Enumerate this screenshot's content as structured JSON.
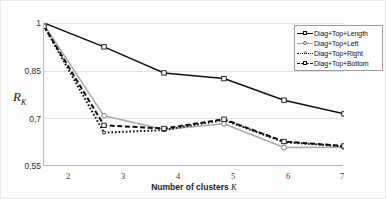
{
  "chart_data": {
    "type": "line",
    "title": "",
    "xlabel": "Number of clusters K",
    "ylabel": "R_K",
    "x": [
      2,
      3,
      4,
      5,
      6,
      7
    ],
    "xticklabels": [
      "2",
      "3",
      "4",
      "5",
      "6",
      "7"
    ],
    "yticklabels": [
      "1",
      "0,85",
      "0,7",
      "0,55"
    ],
    "ytickvalues": [
      1,
      0.85,
      0.7,
      0.55
    ],
    "ylim": [
      0.55,
      1.0
    ],
    "xlim": [
      2,
      7
    ],
    "grid": "horizontal",
    "legend_position": "top-right",
    "series": [
      {
        "name": "Diag+Top+Length",
        "style": "solid",
        "color": "#101010",
        "marker": "square-open",
        "values": [
          1.0,
          0.925,
          0.843,
          0.825,
          0.757,
          0.714
        ]
      },
      {
        "name": "Diag+Top+Left",
        "style": "solid",
        "color": "#a8a8a8",
        "marker": "circle-open",
        "values": [
          0.995,
          0.708,
          0.665,
          0.683,
          0.608,
          0.609
        ]
      },
      {
        "name": "Diag+Top+Right",
        "style": "dotted",
        "color": "#101010",
        "marker": "circle-small",
        "values": [
          0.99,
          0.655,
          0.663,
          0.695,
          0.625,
          0.612
        ]
      },
      {
        "name": "Diag+Top+Bottom",
        "style": "dashed",
        "color": "#101010",
        "marker": "square-open",
        "values": [
          0.99,
          0.678,
          0.668,
          0.697,
          0.627,
          0.613
        ]
      }
    ]
  },
  "axis": {
    "y_title_main": "R",
    "y_title_sub": "K",
    "x_title_text": "Number of clusters",
    "x_title_symbol": "K"
  },
  "yticks": [
    {
      "label": "1"
    },
    {
      "label": "0,85"
    },
    {
      "label": "0,7"
    },
    {
      "label": "0,55"
    }
  ],
  "xticks": [
    {
      "label": "2"
    },
    {
      "label": "3"
    },
    {
      "label": "4"
    },
    {
      "label": "5"
    },
    {
      "label": "6"
    },
    {
      "label": "7"
    }
  ],
  "legend": {
    "items": [
      {
        "label": "Diag+Top+Length"
      },
      {
        "label": "Diag+Top+Left"
      },
      {
        "label": "Diag+Top+Right"
      },
      {
        "label": "Diag+Top+Bottom"
      }
    ]
  }
}
